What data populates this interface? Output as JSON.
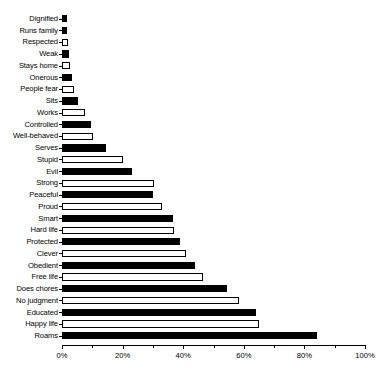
{
  "chart_data": {
    "type": "bar",
    "orientation": "horizontal",
    "title": "",
    "xlabel": "",
    "ylabel": "",
    "xlim": [
      0,
      100
    ],
    "xticks": [
      0,
      20,
      40,
      60,
      80,
      100
    ],
    "xticklabels": [
      "0%",
      "20%",
      "40%",
      "60%",
      "80%",
      "100%"
    ],
    "minor_xticks": [
      10,
      30,
      50,
      70,
      90
    ],
    "grid": false,
    "legend": "none",
    "series_note": "bars alternate fill style: filled (black) and open (white outline)",
    "categories": [
      "Dignified",
      "Runs family",
      "Respected",
      "Weak",
      "Stays home",
      "Onerous",
      "People fear",
      "Sits",
      "Works",
      "Controlled",
      "Well-behaved",
      "Serves",
      "Stupid",
      "Evil",
      "Strong",
      "Peaceful",
      "Proud",
      "Smart",
      "Hard life",
      "Protected",
      "Clever",
      "Obedient",
      "Free life",
      "Does chores",
      "No judgment",
      "Educated",
      "Happy life",
      "Roams"
    ],
    "values": [
      1.5,
      1.8,
      2.0,
      2.2,
      2.6,
      3.2,
      4.0,
      5.2,
      7.6,
      9.6,
      10.2,
      14.5,
      20.0,
      23.0,
      30.5,
      30.0,
      33.0,
      36.5,
      37.0,
      39.0,
      41.0,
      44.0,
      46.5,
      54.5,
      58.5,
      64.0,
      65.0,
      84.0
    ],
    "fills": [
      "filled",
      "filled",
      "open",
      "filled",
      "open",
      "filled",
      "open",
      "filled",
      "open",
      "filled",
      "open",
      "filled",
      "open",
      "filled",
      "open",
      "filled",
      "open",
      "filled",
      "open",
      "filled",
      "open",
      "filled",
      "open",
      "filled",
      "open",
      "filled",
      "open",
      "filled"
    ]
  }
}
